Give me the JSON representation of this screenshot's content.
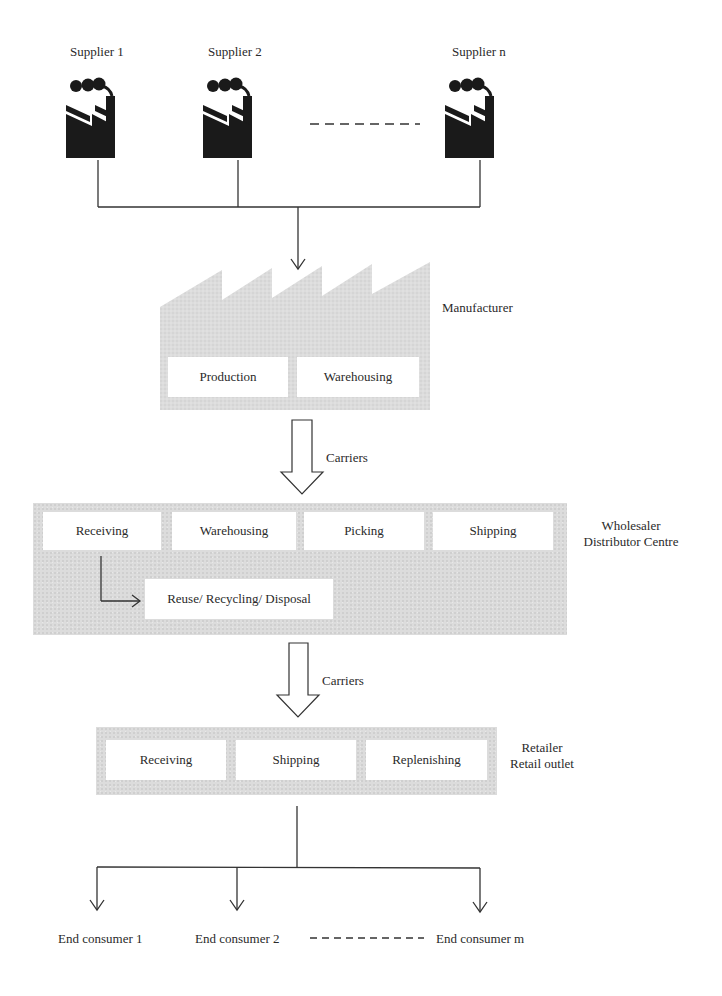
{
  "suppliers": {
    "items": [
      {
        "label": "Supplier 1"
      },
      {
        "label": "Supplier 2"
      },
      {
        "label": "Supplier n"
      }
    ],
    "icon": "factory-icon"
  },
  "manufacturer": {
    "label": "Manufacturer",
    "boxes": [
      "Production",
      "Warehousing"
    ]
  },
  "carriers_1": {
    "label": "Carriers"
  },
  "wholesaler": {
    "label_line1": "Wholesaler",
    "label_line2": "Distributor Centre",
    "boxes": [
      "Receiving",
      "Warehousing",
      "Picking",
      "Shipping"
    ],
    "reverse_box": "Reuse/ Recycling/ Disposal"
  },
  "carriers_2": {
    "label": "Carriers"
  },
  "retailer": {
    "label_line1": "Retailer",
    "label_line2": "Retail outlet",
    "boxes": [
      "Receiving",
      "Shipping",
      "Replenishing"
    ]
  },
  "consumers": {
    "items": [
      {
        "label": "End consumer 1"
      },
      {
        "label": "End consumer 2"
      },
      {
        "label": "End consumer m"
      }
    ]
  },
  "colors": {
    "stage_fill": "#dcdcdc",
    "box_fill": "#ffffff",
    "line": "#333333",
    "icon": "#1a1a1a"
  }
}
